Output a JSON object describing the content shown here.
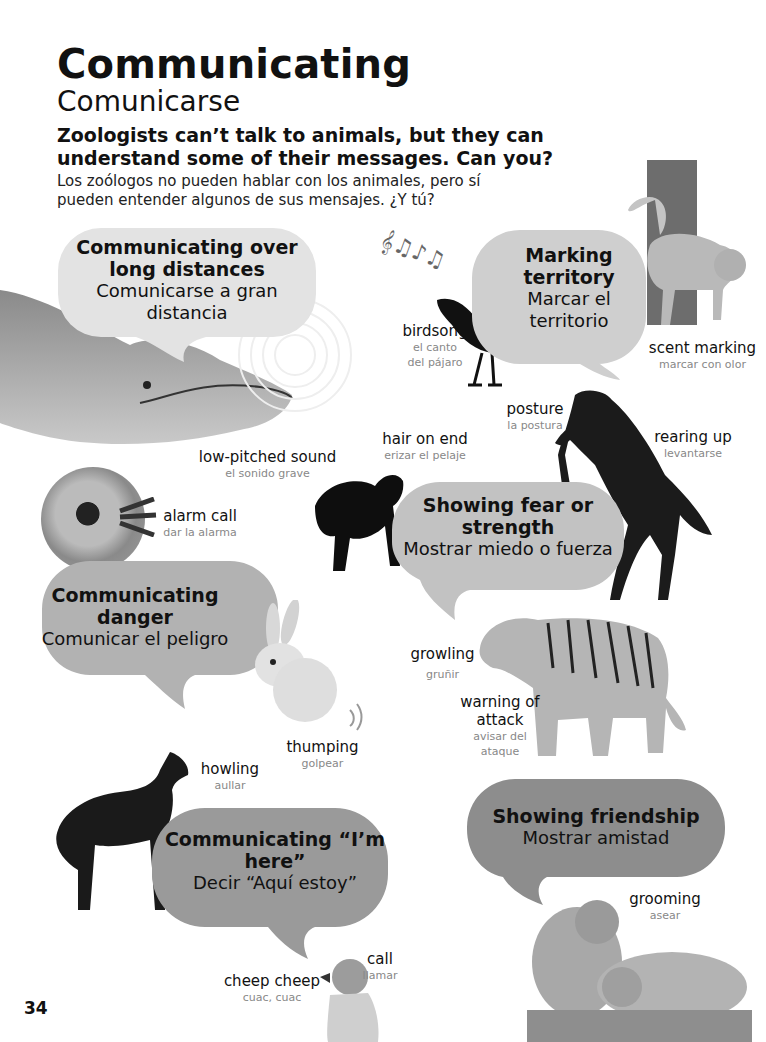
{
  "page": {
    "title": "Communicating",
    "subtitle": "Comunicarse",
    "intro_en": "Zoologists can’t talk to animals, but they can understand some of their messages. Can you?",
    "intro_es": "Los zoólogos no pueden hablar con los animales, pero sí pueden entender algunos de sus mensajes. ¿Y tú?",
    "page_number": "34"
  },
  "bubbles": [
    {
      "en": "Communicating over long distances",
      "es": "Comunicarse a gran distancia",
      "shade": "#e3e3e3"
    },
    {
      "en": "Marking territory",
      "es": "Marcar el territorio",
      "shade": "#cfcfcf"
    },
    {
      "en": "Showing fear or strength",
      "es": "Mostrar miedo o fuerza",
      "shade": "#c2c2c2"
    },
    {
      "en": "Communicating danger",
      "es": "Comunicar el peligro",
      "shade": "#b2b2b2"
    },
    {
      "en": "Communicating “I’m here”",
      "es": "Decir “Aquí estoy”",
      "shade": "#9a9a9a"
    },
    {
      "en": "Showing friendship",
      "es": "Mostrar amistad",
      "shade": "#8d8d8d"
    }
  ],
  "labels": [
    {
      "id": "birdsong",
      "en": "birdsong",
      "es": "el canto del pájaro"
    },
    {
      "id": "scent-marking",
      "en": "scent marking",
      "es": "marcar con olor"
    },
    {
      "id": "low-pitched-sound",
      "en": "low-pitched sound",
      "es": "el sonido grave"
    },
    {
      "id": "posture",
      "en": "posture",
      "es": "la postura"
    },
    {
      "id": "hair-on-end",
      "en": "hair on end",
      "es": "erizar el pelaje"
    },
    {
      "id": "rearing-up",
      "en": "rearing up",
      "es": "levantarse"
    },
    {
      "id": "alarm-call",
      "en": "alarm call",
      "es": "dar la alarma"
    },
    {
      "id": "growling",
      "en": "growling",
      "es": "gruñir"
    },
    {
      "id": "warning-of-attack",
      "en": "warning of attack",
      "es": "avisar del ataque"
    },
    {
      "id": "thumping",
      "en": "thumping",
      "es": "golpear"
    },
    {
      "id": "howling",
      "en": "howling",
      "es": "aullar"
    },
    {
      "id": "grooming",
      "en": "grooming",
      "es": "asear"
    },
    {
      "id": "call",
      "en": "call",
      "es": "llamar"
    },
    {
      "id": "cheep-cheep",
      "en": "cheep cheep",
      "es": "cuac, cuac"
    }
  ],
  "animals": [
    "whale",
    "blackbird",
    "cat",
    "horse",
    "black-cat",
    "monkey",
    "rabbit",
    "tiger",
    "wolf",
    "duckling",
    "macaques"
  ]
}
